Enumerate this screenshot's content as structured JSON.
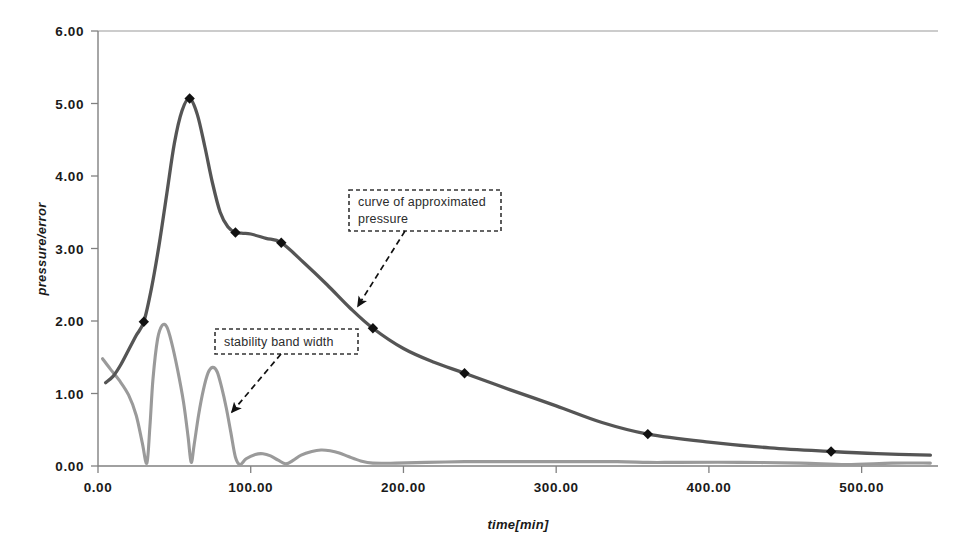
{
  "chart_data": {
    "type": "line",
    "title": "",
    "xlabel": "time[min]",
    "ylabel": "pressure/error",
    "xlim": [
      0,
      550
    ],
    "ylim": [
      0,
      6
    ],
    "grid": false,
    "legend_position": "none",
    "x_ticks": [
      "0.00",
      "100.00",
      "200.00",
      "300.00",
      "400.00",
      "500.00"
    ],
    "x_tick_values": [
      0,
      100,
      200,
      300,
      400,
      500
    ],
    "y_ticks": [
      "0.00",
      "1.00",
      "2.00",
      "3.00",
      "4.00",
      "5.00",
      "6.00"
    ],
    "y_tick_values": [
      0,
      1,
      2,
      3,
      4,
      5,
      6
    ],
    "series": [
      {
        "name": "curve of approximated pressure",
        "color": "#555555",
        "marker": "diamond",
        "marker_color": "#111111",
        "x": [
          5,
          10,
          15,
          20,
          25,
          30,
          35,
          40,
          45,
          50,
          55,
          60,
          65,
          70,
          75,
          80,
          85,
          90,
          95,
          100,
          110,
          120,
          135,
          150,
          165,
          180,
          200,
          220,
          240,
          270,
          300,
          330,
          360,
          400,
          440,
          480,
          510,
          545
        ],
        "y": [
          1.15,
          1.24,
          1.4,
          1.6,
          1.8,
          1.99,
          2.45,
          3.05,
          3.75,
          4.45,
          4.9,
          5.07,
          4.85,
          4.4,
          3.9,
          3.5,
          3.3,
          3.22,
          3.21,
          3.2,
          3.14,
          3.08,
          2.8,
          2.5,
          2.18,
          1.9,
          1.62,
          1.43,
          1.28,
          1.05,
          0.83,
          0.6,
          0.44,
          0.33,
          0.25,
          0.2,
          0.17,
          0.15
        ],
        "marker_points": [
          {
            "x": 30,
            "y": 1.99
          },
          {
            "x": 60,
            "y": 5.07
          },
          {
            "x": 90,
            "y": 3.22
          },
          {
            "x": 120,
            "y": 3.08
          },
          {
            "x": 180,
            "y": 1.9
          },
          {
            "x": 240,
            "y": 1.28
          },
          {
            "x": 360,
            "y": 0.44
          },
          {
            "x": 480,
            "y": 0.2
          }
        ]
      },
      {
        "name": "stability band width",
        "color": "#9a9a9a",
        "marker": "none",
        "x": [
          3,
          8,
          14,
          20,
          25,
          29,
          32,
          34,
          36,
          39,
          42,
          45,
          48,
          52,
          56,
          59,
          61,
          63,
          66,
          69,
          72,
          75,
          78,
          81,
          84,
          87,
          90,
          93,
          97,
          103,
          108,
          113,
          118,
          123,
          128,
          133,
          140,
          146,
          152,
          158,
          164,
          172,
          180,
          195,
          215,
          240,
          260,
          300,
          340,
          360,
          380,
          420,
          460,
          490,
          520,
          545
        ],
        "y": [
          1.48,
          1.34,
          1.18,
          0.98,
          0.7,
          0.32,
          0.04,
          0.55,
          1.2,
          1.75,
          1.94,
          1.92,
          1.72,
          1.34,
          0.88,
          0.4,
          0.05,
          0.3,
          0.72,
          1.05,
          1.28,
          1.36,
          1.3,
          1.08,
          0.8,
          0.46,
          0.12,
          0.02,
          0.1,
          0.16,
          0.17,
          0.14,
          0.08,
          0.03,
          0.08,
          0.15,
          0.2,
          0.22,
          0.21,
          0.18,
          0.13,
          0.07,
          0.04,
          0.04,
          0.05,
          0.06,
          0.06,
          0.06,
          0.06,
          0.05,
          0.05,
          0.05,
          0.04,
          0.02,
          0.04,
          0.04
        ]
      }
    ],
    "annotations": [
      {
        "id": "annotation-pressure-curve",
        "text": "curve of approximated pressure",
        "line1": "curve of approximated",
        "line2": "pressure",
        "box": {
          "x": 349,
          "y": 190,
          "w": 152,
          "h": 41
        },
        "arrow_from": {
          "x": 405,
          "y": 231
        },
        "arrow_to": {
          "x": 358,
          "y": 306
        }
      },
      {
        "id": "annotation-stability-band",
        "text": "stability band width",
        "line1": "stability band width",
        "line2": "",
        "box": {
          "x": 215,
          "y": 329,
          "w": 143,
          "h": 25
        },
        "arrow_from": {
          "x": 281,
          "y": 354
        },
        "arrow_to": {
          "x": 232,
          "y": 412
        }
      }
    ]
  },
  "colors": {
    "pressure_curve": "#555555",
    "stability_curve": "#9a9a9a",
    "axis": "#808080",
    "marker": "#111111",
    "text": "#1a1a1a",
    "background": "#ffffff"
  }
}
